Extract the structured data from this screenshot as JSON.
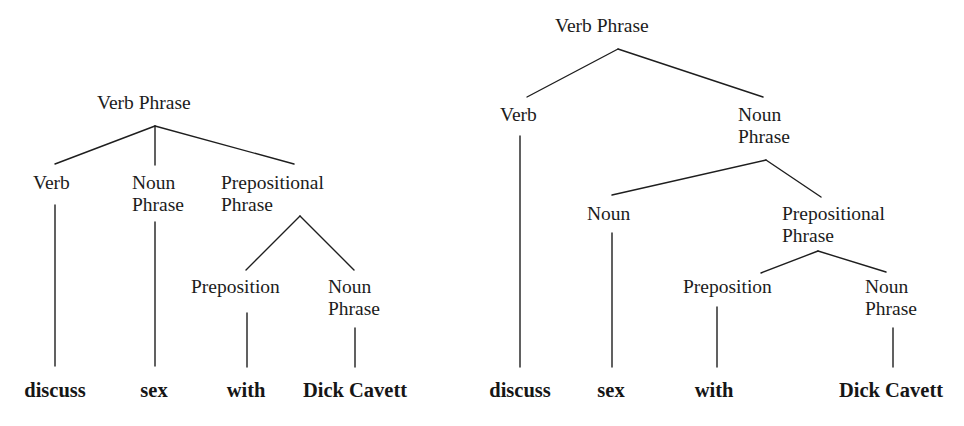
{
  "diagram": {
    "type": "parse-trees",
    "left_tree": {
      "root": "Verb Phrase",
      "nodes": {
        "root": "Verb Phrase",
        "verb": "Verb",
        "np_line1": "Noun",
        "np_line2": "Phrase",
        "pp_line1": "Prepositional",
        "pp_line2": "Phrase",
        "prep": "Preposition",
        "np2_line1": "Noun",
        "np2_line2": "Phrase"
      },
      "leaves": [
        "discuss",
        "sex",
        "with",
        "Dick Cavett"
      ],
      "structure": "[VP [Verb discuss] [NP sex] [PP [Preposition with] [NP Dick Cavett]]]"
    },
    "right_tree": {
      "root": "Verb Phrase",
      "nodes": {
        "root": "Verb Phrase",
        "verb": "Verb",
        "np_line1": "Noun",
        "np_line2": "Phrase",
        "noun": "Noun",
        "pp_line1": "Prepositional",
        "pp_line2": "Phrase",
        "prep": "Preposition",
        "np2_line1": "Noun",
        "np2_line2": "Phrase"
      },
      "leaves": [
        "discuss",
        "sex",
        "with",
        "Dick Cavett"
      ],
      "structure": "[VP [Verb discuss] [NP [Noun sex] [PP [Preposition with] [NP Dick Cavett]]]]"
    },
    "colors": {
      "ink": "#1c1c1c",
      "background": "#ffffff"
    }
  }
}
